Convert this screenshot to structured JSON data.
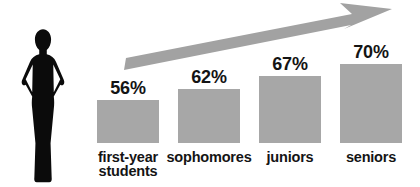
{
  "figure": {
    "colors": {
      "background": "#ffffff",
      "bar": "#a7a7a7",
      "arrow": "#a2a2a2",
      "silhouette": "#0b0b0b",
      "text": "#141414"
    },
    "icons": {
      "person": "woman-silhouette-icon",
      "trend": "upward-arrow-icon"
    }
  },
  "chart_data": {
    "type": "bar",
    "title": "",
    "xlabel": "",
    "ylabel": "",
    "categories": [
      "first-year students",
      "sophomores",
      "juniors",
      "seniors"
    ],
    "values": [
      56,
      62,
      67,
      70
    ],
    "data_labels": [
      "56%",
      "62%",
      "67%",
      "70%"
    ],
    "ylim": [
      0,
      100
    ],
    "grid": false,
    "legend": "none",
    "bar_heights_px": [
      43,
      54,
      67,
      79
    ],
    "annotation": "upward trend arrow rising left-to-right above the bars"
  }
}
